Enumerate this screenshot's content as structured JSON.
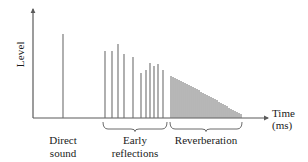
{
  "figure": {
    "title": "",
    "background_color": "#ffffff",
    "line_color": "#6e6e6e",
    "axis_color": "#5a5a5a",
    "text_color": "#1a1a1a"
  },
  "axes": {
    "y_label": "Level",
    "x_label_line1": "Time",
    "x_label_line2": "(ms)",
    "origin_x": 33,
    "origin_y": 118,
    "y_top": 9,
    "x_right": 268
  },
  "regions": [
    {
      "key": "direct",
      "label_line1": "Direct",
      "label_line2": "sound",
      "brace": false,
      "start_x": 33,
      "end_x": 95
    },
    {
      "key": "early",
      "label_line1": "Early",
      "label_line2": "reflections",
      "brace": true,
      "start_x": 103,
      "end_x": 167
    },
    {
      "key": "reverberation",
      "label_line1": "Reverberation",
      "label_line2": "",
      "brace": true,
      "start_x": 170,
      "end_x": 242
    }
  ],
  "chart_data": {
    "type": "bar",
    "xlabel": "Time (ms)",
    "ylabel": "Level",
    "xlim": [
      0,
      308
    ],
    "ylim": [
      0,
      109
    ],
    "grid": false,
    "legend": "none",
    "annotations": [
      "Direct sound",
      "Early reflections",
      "Reverberation"
    ],
    "series": [
      {
        "name": "Direct sound",
        "color": "#6e6e6e",
        "x": [
          63
        ],
        "values": [
          84
        ]
      },
      {
        "name": "Early reflections",
        "color": "#6e6e6e",
        "x": [
          105,
          112,
          118,
          124,
          133,
          141,
          146,
          150,
          154,
          158,
          163
        ],
        "values": [
          67,
          67,
          74,
          64,
          61,
          45,
          48,
          55,
          52,
          54,
          48
        ]
      },
      {
        "name": "Reverberation",
        "color": "#6e6e6e",
        "x": [
          171,
          173,
          175,
          177,
          179,
          181,
          183,
          185,
          187,
          189,
          191,
          193,
          195,
          197,
          199,
          201,
          203,
          205,
          207,
          209,
          211,
          213,
          215,
          217,
          219,
          221,
          223,
          225,
          227,
          229,
          231,
          233,
          235,
          237,
          239,
          241
        ],
        "values": [
          42,
          41,
          40,
          39,
          38,
          37,
          36,
          35,
          34,
          33,
          32,
          31,
          30,
          29,
          28,
          26,
          25,
          24,
          23,
          22,
          21,
          20,
          19,
          18,
          16,
          15,
          14,
          13,
          12,
          10,
          9,
          8,
          7,
          6,
          5,
          4
        ]
      }
    ]
  }
}
